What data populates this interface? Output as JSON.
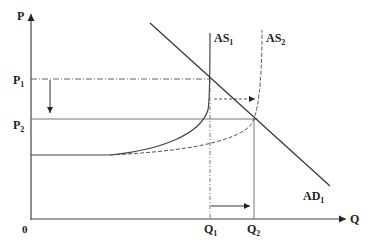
{
  "diagram": {
    "type": "economics AD-AS",
    "axes": {
      "y_label": "P",
      "x_label": "Q",
      "origin": "0"
    },
    "price_labels": {
      "p1": "P",
      "p1_sub": "1",
      "p2": "P",
      "p2_sub": "2"
    },
    "quantity_labels": {
      "q1": "Q",
      "q1_sub": "1",
      "q2": "Q",
      "q2_sub": "2"
    },
    "curves": {
      "as1": "AS",
      "as1_sub": "1",
      "as2": "AS",
      "as2_sub": "2",
      "ad1": "AD",
      "ad1_sub": "1"
    }
  }
}
